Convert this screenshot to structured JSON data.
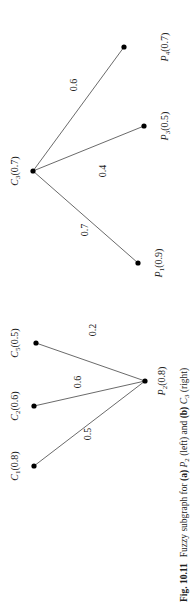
{
  "figure": {
    "caption": {
      "number": "Fig. 10.11",
      "text_a": "Fuzzy subgraph for ",
      "a": "(a)",
      "mid_1": " ",
      "p2": "P",
      "p2_sub": "2",
      "mid_2": " (left) and ",
      "b": "(b)",
      "mid_3": " ",
      "c3": "C",
      "c3_sub": "3",
      "end": " (right)"
    },
    "orientation": "rotated 90° counterclockwise",
    "subgraph_a": {
      "center": {
        "name": "P",
        "sub": "2",
        "value": "(0.8)"
      },
      "nodes": [
        {
          "name": "C",
          "sub": "1",
          "value": "(0.8)"
        },
        {
          "name": "C",
          "sub": "2",
          "value": "(0.6)"
        },
        {
          "name": "C",
          "sub": "5",
          "value": "(0.5)"
        }
      ],
      "edges": [
        {
          "from": "C1",
          "to": "P2",
          "weight": "0.5"
        },
        {
          "from": "C2",
          "to": "P2",
          "weight": "0.6"
        },
        {
          "from": "C5",
          "to": "P2",
          "weight": "0.2"
        }
      ]
    },
    "subgraph_b": {
      "center": {
        "name": "C",
        "sub": "3",
        "value": "(0.7)"
      },
      "nodes": [
        {
          "name": "P",
          "sub": "1",
          "value": "(0.9)"
        },
        {
          "name": "P",
          "sub": "3",
          "value": "(0.5)"
        },
        {
          "name": "P",
          "sub": "4",
          "value": "(0.7)"
        }
      ],
      "edges": [
        {
          "from": "C3",
          "to": "P1",
          "weight": "0.7"
        },
        {
          "from": "C3",
          "to": "P3",
          "weight": "0.4"
        },
        {
          "from": "C3",
          "to": "P4",
          "weight": "0.6"
        }
      ]
    }
  }
}
